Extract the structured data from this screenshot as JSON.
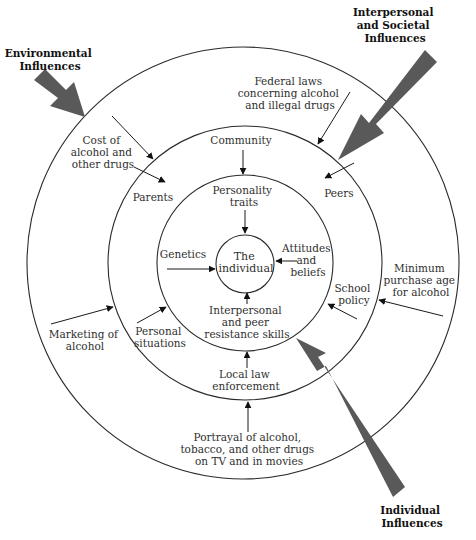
{
  "diagram": {
    "type": "concentric-influence-model",
    "colors": {
      "ring_stroke": "#2b2b2b",
      "big_arrow_fill": "#595959",
      "text": "#2f2f2f",
      "category_text": "#111111"
    },
    "center": {
      "lines": [
        "The",
        "individual"
      ]
    },
    "categories": {
      "environmental": {
        "lines": [
          "Environmental",
          "Influences"
        ]
      },
      "interpersonal_societal": {
        "lines": [
          "Interpersonal",
          "and Societal",
          "Influences"
        ]
      },
      "individual": {
        "lines": [
          "Individual",
          "Influences"
        ]
      }
    },
    "rings": {
      "individual_ring": {
        "factors": {
          "personality_traits": {
            "lines": [
              "Personality",
              "traits"
            ]
          },
          "genetics": {
            "lines": [
              "Genetics"
            ]
          },
          "attitudes_beliefs": {
            "lines": [
              "Attitudes",
              "and",
              "beliefs"
            ]
          },
          "resistance_skills": {
            "lines": [
              "Interpersonal",
              "and peer",
              "resistance skills"
            ]
          }
        }
      },
      "interpersonal_ring": {
        "factors": {
          "community": {
            "lines": [
              "Community"
            ]
          },
          "parents": {
            "lines": [
              "Parents"
            ]
          },
          "peers": {
            "lines": [
              "Peers"
            ]
          },
          "school_policy": {
            "lines": [
              "School",
              "policy"
            ]
          },
          "personal_situations": {
            "lines": [
              "Personal",
              "situations"
            ]
          },
          "local_law": {
            "lines": [
              "Local law",
              "enforcement"
            ]
          }
        }
      },
      "environmental_ring": {
        "factors": {
          "cost": {
            "lines": [
              "Cost of",
              "alcohol and",
              "other drugs"
            ]
          },
          "federal_laws": {
            "lines": [
              "Federal laws",
              "concerning alcohol",
              "and illegal drugs"
            ]
          },
          "minimum_age": {
            "lines": [
              "Minimum",
              "purchase age",
              "for alcohol"
            ]
          },
          "marketing": {
            "lines": [
              "Marketing of",
              "alcohol"
            ]
          },
          "portrayal": {
            "lines": [
              "Portrayal of alcohol,",
              "tobacco, and other drugs",
              "on TV and in movies"
            ]
          }
        }
      }
    }
  }
}
